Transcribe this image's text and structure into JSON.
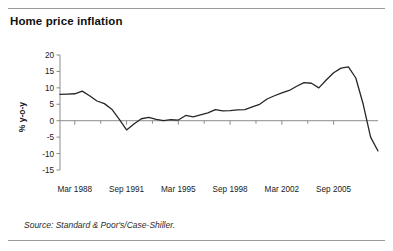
{
  "title": "Home price inflation",
  "source": "Source: Standard & Poor's/Case-Shiller.",
  "chart_data": {
    "type": "line",
    "title": "Home price inflation",
    "xlabel": "",
    "ylabel": "% y-o-y",
    "ylim": [
      -15,
      20
    ],
    "yticks": [
      20,
      15,
      10,
      5,
      0,
      -5,
      -10,
      -15
    ],
    "ytick_labels": [
      "20",
      "15",
      "10",
      "5",
      "0",
      "-5",
      "-10",
      "-15"
    ],
    "xtick_labels": [
      "Mar 1988",
      "Sep 1991",
      "Mar 1995",
      "Sep 1998",
      "Mar 2002",
      "Sep 2005"
    ],
    "grid": false,
    "legend": "none",
    "zero_line": true,
    "line_color": "#262626",
    "axis_color": "#8c8c8c",
    "series": [
      {
        "name": "Home price inflation",
        "x": [
          "Mar 1987",
          "Sep 1987",
          "Mar 1988",
          "Sep 1988",
          "Mar 1989",
          "Sep 1989",
          "Mar 1990",
          "Sep 1990",
          "Mar 1991",
          "Sep 1991",
          "Mar 1992",
          "Sep 1992",
          "Mar 1993",
          "Sep 1993",
          "Mar 1994",
          "Sep 1994",
          "Mar 1995",
          "Sep 1995",
          "Mar 1996",
          "Sep 1996",
          "Mar 1997",
          "Sep 1997",
          "Mar 1998",
          "Sep 1998",
          "Mar 1999",
          "Sep 1999",
          "Mar 2000",
          "Sep 2000",
          "Mar 2001",
          "Sep 2001",
          "Mar 2002",
          "Sep 2002",
          "Mar 2003",
          "Sep 2003",
          "Mar 2004",
          "Sep 2004",
          "Mar 2005",
          "Sep 2005",
          "Mar 2006",
          "Sep 2006",
          "Mar 2007",
          "Sep 2007",
          "Mar 2008",
          "Sep 2008"
        ],
        "values": [
          8.0,
          8.1,
          8.2,
          9.0,
          7.6,
          6.0,
          5.2,
          3.5,
          0.5,
          -2.8,
          -1.0,
          0.6,
          1.0,
          0.4,
          0.0,
          0.3,
          0.2,
          1.6,
          1.2,
          1.8,
          2.4,
          3.4,
          3.0,
          3.1,
          3.3,
          3.4,
          4.2,
          5.0,
          6.6,
          7.6,
          8.5,
          9.2,
          10.5,
          11.6,
          11.4,
          10.0,
          12.4,
          14.6,
          16.0,
          16.4,
          13.0,
          5.0,
          -5.0,
          -9.2
        ]
      }
    ]
  }
}
